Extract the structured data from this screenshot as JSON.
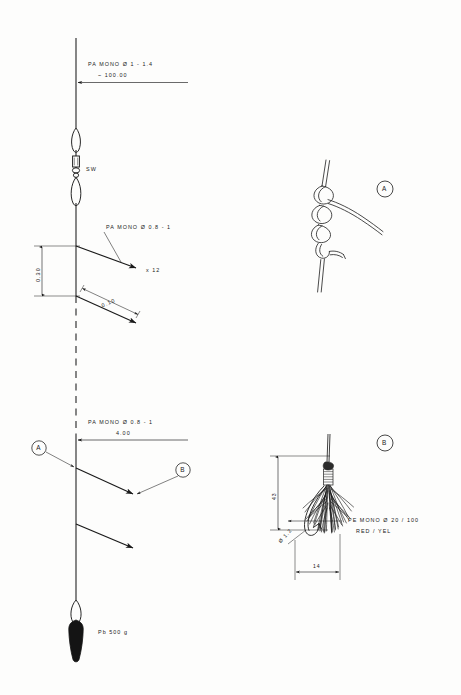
{
  "document": {
    "title": "Fishing Rig Assembly Drawing",
    "background_color": "#fdfdfc",
    "line_color": "#1a1a1a"
  },
  "main_rig": {
    "mainline": {
      "label_line1": "PA  MONO  Ø  1 - 1.4",
      "label_line2": "~  100.00"
    },
    "swivel": {
      "label": "SW"
    },
    "snood": {
      "label": "PA  MONO  Ø  0.8 - 1",
      "count_label": "x  12"
    },
    "dimensions": {
      "spacing_vertical": "0.30",
      "snood_length": "0.10"
    },
    "lower_section": {
      "label_line1": "PA  MONO  Ø  0.8 - 1",
      "label_line2": "4.00"
    },
    "sinker": {
      "label": "Pb  500  g"
    },
    "callouts": [
      {
        "id": "A",
        "name": "detail-callout-a"
      },
      {
        "id": "B",
        "name": "detail-callout-b"
      }
    ]
  },
  "detail_a": {
    "id": "A",
    "caption": "A"
  },
  "detail_b": {
    "id": "B",
    "caption": "B",
    "material_line1": "PE  MONO  Ø  20 / 100",
    "material_line2": "RED / YEL",
    "dimensions": {
      "height": "43",
      "hook_size": "Ø 1.2",
      "width": "14"
    }
  }
}
